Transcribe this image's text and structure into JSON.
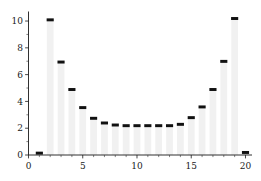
{
  "chart_data": {
    "type": "bar",
    "title": "",
    "subtitle": "",
    "xlabel": "",
    "ylabel": "",
    "categories": [
      1,
      2,
      3,
      4,
      5,
      6,
      7,
      8,
      9,
      10,
      11,
      12,
      13,
      14,
      15,
      16,
      17,
      18,
      19,
      20
    ],
    "values": [
      0.15,
      10.1,
      6.95,
      4.9,
      3.55,
      2.75,
      2.4,
      2.25,
      2.2,
      2.2,
      2.2,
      2.2,
      2.2,
      2.3,
      2.8,
      3.6,
      4.9,
      7.0,
      10.2,
      0.2
    ],
    "series": [
      {
        "name": "values",
        "values": [
          0.15,
          10.1,
          6.95,
          4.9,
          3.55,
          2.75,
          2.4,
          2.25,
          2.2,
          2.2,
          2.2,
          2.2,
          2.2,
          2.3,
          2.8,
          3.6,
          4.9,
          7.0,
          10.2,
          0.2
        ]
      }
    ],
    "xlim": [
      0,
      20.6
    ],
    "ylim": [
      0,
      10.6
    ],
    "x_ticks_major": [
      0,
      5,
      10,
      15,
      20
    ],
    "x_tick_labels": [
      "0",
      "5",
      "10",
      "15",
      "20"
    ],
    "x_ticks_minor": [
      1,
      2,
      3,
      4,
      6,
      7,
      8,
      9,
      11,
      12,
      13,
      14,
      16,
      17,
      18,
      19
    ],
    "y_ticks_major": [
      0,
      2,
      4,
      6,
      8,
      10
    ],
    "y_tick_labels": [
      "0",
      "2",
      "4",
      "6",
      "8",
      "10"
    ],
    "y_ticks_minor": [
      1,
      3,
      5,
      7,
      9
    ],
    "grid": false,
    "legend": null,
    "legend_position": "none",
    "bar_fill_color": "#f1f1f1",
    "bar_cap_color": "#111111",
    "axis_color": "#1a1a1a",
    "background_color": "#ffffff",
    "bar_width": 0.62,
    "cap_thickness_units": 0.22
  }
}
